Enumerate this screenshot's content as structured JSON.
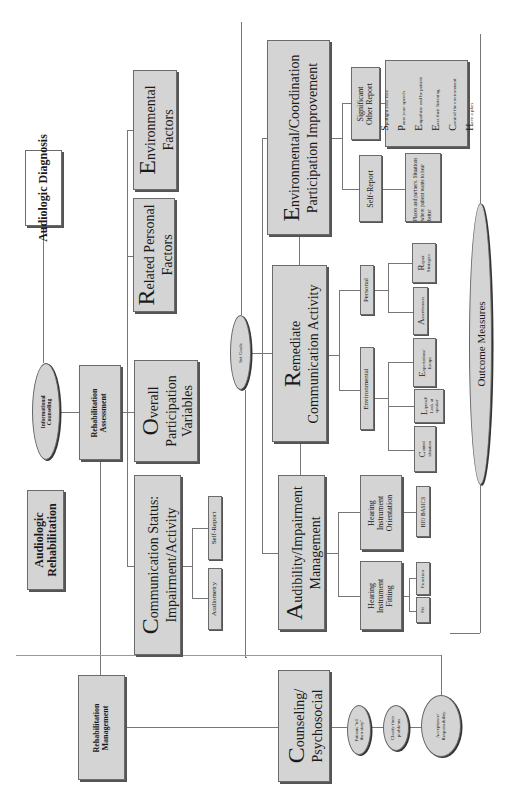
{
  "diagram": {
    "orientation": "rotated-90-ccw",
    "audiologic_diagnosis": "Audiologic Diagnosis",
    "audiologic_rehabilitation": "Audiologic Rehabilitation",
    "informational_counseling": "Informational Counseling",
    "rehabilitation_assessment": "Rehabilitation Assessment",
    "rehabilitation_management": "Rehabilitation Management",
    "core": {
      "c": {
        "initial": "C",
        "rest_line1": "ommunication Status:",
        "line2": "Impairment/Activity"
      },
      "o": {
        "initial": "O",
        "rest_line1": "verall",
        "line2": "Participation",
        "line3": "Variables"
      },
      "r": {
        "initial": "R",
        "rest_line1": "elated Personal",
        "line2": "Factors"
      },
      "e": {
        "initial": "E",
        "rest_line1": "nvironmental",
        "line2": "Factors"
      }
    },
    "assessment_children": {
      "audiometry": "Audiometry",
      "self_report": "Self-Report"
    },
    "set_goals": "Set Goals",
    "management": {
      "a": {
        "initial": "A",
        "rest_line1": "udibility/Impairment",
        "line2": "Management"
      },
      "r": {
        "initial": "R",
        "rest_line1": "emediate",
        "line2": "Communication Activity"
      },
      "e": {
        "initial": "E",
        "rest_line1": "nvironmental/Coordination",
        "line2": "Participation Improvement"
      },
      "c": {
        "initial": "C",
        "rest_line1": "ounseling/",
        "line2": "Psychosocial"
      }
    },
    "audibility_children": {
      "fitting": {
        "label_lines": [
          "Hearing",
          "Instrument",
          "Fitting"
        ],
        "children": [
          "Fit",
          "Function"
        ]
      },
      "orientation": {
        "label_lines": [
          "Hearing",
          "Instrument",
          "Orientation"
        ],
        "children": [
          "HIO BASICS"
        ]
      }
    },
    "remediate_children": {
      "environmental": {
        "label": "Environmental",
        "children": [
          {
            "initial": "C",
            "rest": "ontrol",
            "line2": "situation"
          },
          {
            "initial": "L",
            "rest": "ipread/",
            "line2": "Look at",
            "line3": "speaker"
          },
          {
            "initial": "E",
            "rest": "xpectations/",
            "line2": "Escape"
          }
        ]
      },
      "personal": {
        "label": "Personal",
        "children": [
          {
            "initial": "A",
            "rest": "ssertiveness"
          },
          {
            "initial": "R",
            "rest": "epair",
            "line2": "Strategies"
          }
        ]
      }
    },
    "environmental_children": {
      "self_report": {
        "label": "Self-Report",
        "note": "Places and partners. Situations where patient wants to hear better"
      },
      "significant_other": {
        "label_lines": [
          "Significant",
          "Other Report"
        ],
        "speech": [
          {
            "initial": "S",
            "rest": "potlight your face"
          },
          {
            "initial": "P",
            "rest": "ause your speech"
          },
          {
            "initial": "E",
            "rest": "mpathize and be patient"
          },
          {
            "initial": "E",
            "rest": "ase their listening"
          },
          {
            "initial": "C",
            "rest": "ontrol the environment"
          },
          {
            "initial": "H",
            "rest": "ave a plan"
          }
        ]
      }
    },
    "counseling_steps": [
      {
        "line1": "Patients \"tell",
        "line2": "their story\""
      },
      {
        "line1": "Clarify their",
        "line2": "problems"
      },
      {
        "line1": "Acceptance/",
        "line2": "Responsibility"
      }
    ],
    "outcome_measures": "Outcome Measures"
  }
}
